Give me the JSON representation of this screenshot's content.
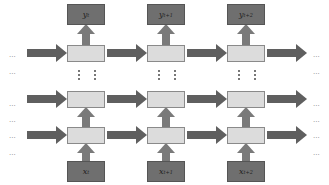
{
  "diagram": {
    "type": "stacked recurrent network unrolled over time",
    "colors": {
      "io_box": "#6f6f6f",
      "hidden_box": "#dcdcdc",
      "arrow": "#5f5f5f",
      "vertical_arrow": "#7a7a7a"
    },
    "columns": [
      {
        "output_label": "y",
        "output_sup": "t",
        "input_label": "x",
        "input_sup": "t"
      },
      {
        "output_label": "y",
        "output_sup": "t+1",
        "input_label": "x",
        "input_sup": "t+1"
      },
      {
        "output_label": "y",
        "output_sup": "t+2",
        "input_label": "x",
        "input_sup": "t+2"
      }
    ],
    "hidden_layers": 3,
    "ellipsis": "···",
    "left_ellipses": [
      "···",
      "···",
      "···",
      "···",
      "···",
      "···"
    ],
    "right_ellipses": [
      "···",
      "···",
      "···",
      "···",
      "···",
      "···"
    ]
  }
}
